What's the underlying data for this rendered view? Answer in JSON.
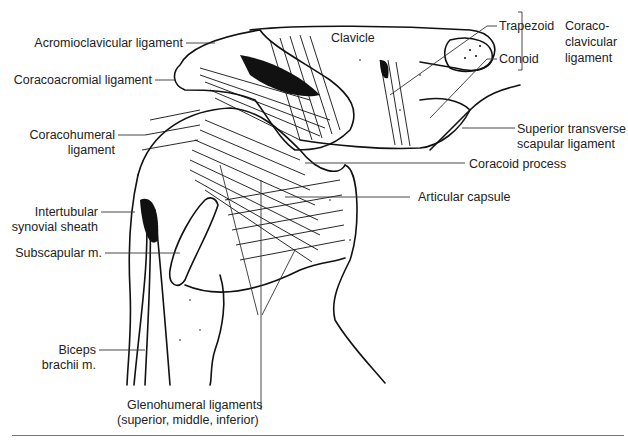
{
  "figure": {
    "labels": {
      "acromioclavicular": "Acromioclavicular ligament",
      "clavicle": "Clavicle",
      "coracoacromial": "Coracoacromial ligament",
      "coracohumeral_1": "Coracohumeral",
      "coracohumeral_2": "ligament",
      "trapezoid": "Trapezoid",
      "conoid": "Conoid",
      "coracoclavicular_1": "Coraco-",
      "coracoclavicular_2": "clavicular",
      "coracoclavicular_3": "ligament",
      "sup_transverse_1": "Superior transverse",
      "sup_transverse_2": "scapular ligament",
      "coracoid": "Coracoid process",
      "articular_capsule": "Articular capsule",
      "intertubular_1": "Intertubular",
      "intertubular_2": "synovial sheath",
      "subscapular": "Subscapular m.",
      "biceps_1": "Biceps",
      "biceps_2": "brachii m.",
      "glenohumeral_1": "Glenohumeral ligaments",
      "glenohumeral_2": "(superior, middle, inferior)"
    }
  }
}
